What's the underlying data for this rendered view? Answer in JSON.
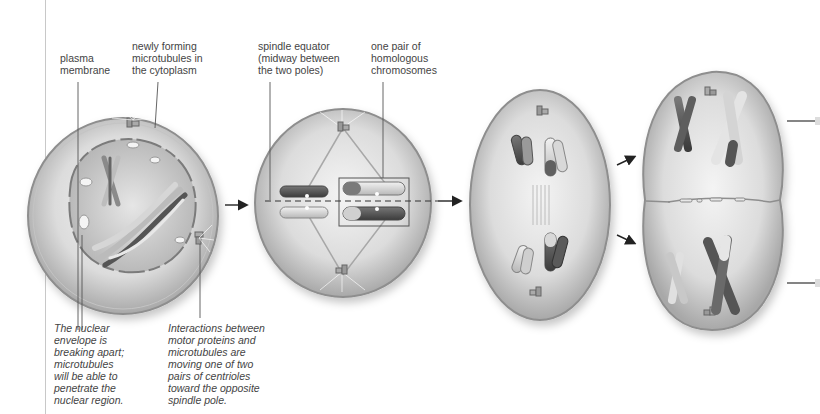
{
  "figure": {
    "type": "meiosis-stage-sequence",
    "style": "grayscale textbook illustration"
  },
  "labels": {
    "plasma_membrane": "plasma\nmembrane",
    "newly_forming_microtubules": "newly forming\nmicrotubules in\nthe cytoplasm",
    "spindle_equator": "spindle equator\n(midway between\nthe two poles)",
    "homologous_pair": "one pair of\nhomologous\nchromosomes"
  },
  "captions": {
    "nuclear_envelope": "The nuclear\nenvelope is\nbreaking apart;\nmicrotubules\nwill be able to\npenetrate the\nnuclear region.",
    "motor_proteins": "Interactions between\nmotor proteins and\nmicrotubules are\nmoving one of two\npairs of centrioles\ntoward the opposite\nspindle pole."
  },
  "stages": [
    {
      "id": "prophase-i",
      "description": "cell with nucleus breaking apart"
    },
    {
      "id": "metaphase-i",
      "description": "homologous pairs aligned at spindle equator"
    },
    {
      "id": "anaphase-i",
      "description": "homologues moving to opposite poles"
    },
    {
      "id": "telophase-i",
      "description": "cytoplasm dividing into two cells"
    }
  ],
  "colors": {
    "cell_fill": "#d9d9d9",
    "cell_edge": "#9a9a9a",
    "dark_chromosome": "#5a5a5a",
    "light_chromosome": "#cfcfcf",
    "arrow": "#222222",
    "leader_line": "#555555"
  }
}
